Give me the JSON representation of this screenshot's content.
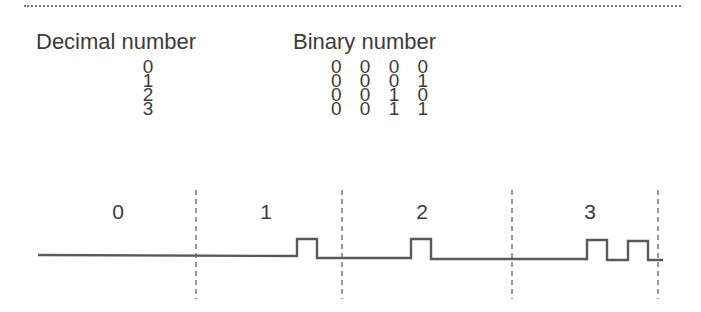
{
  "table": {
    "headers": {
      "decimal": "Decimal number",
      "binary": "Binary number"
    },
    "rows": [
      {
        "decimal": "0",
        "binary": "0 0 0 0"
      },
      {
        "decimal": "1",
        "binary": "0 0 0 1"
      },
      {
        "decimal": "2",
        "binary": "0 0 1 0"
      },
      {
        "decimal": "3",
        "binary": "0 0 1 1"
      }
    ]
  },
  "timing_diagram": {
    "slot_labels": [
      "0",
      "1",
      "2",
      "3"
    ],
    "pulse_counts": [
      0,
      1,
      1,
      2
    ],
    "baseline_y": 255,
    "pulse_top_y": 239,
    "waveform_start_x": 38,
    "waveform_end_x": 663,
    "divider_x": [
      196,
      342,
      512,
      658
    ],
    "pulses": [
      {
        "slot": "1",
        "x_start": 297,
        "x_end": 317
      },
      {
        "slot": "2",
        "x_start": 411,
        "x_end": 431
      },
      {
        "slot": "3",
        "x_start": 587,
        "x_end": 607
      },
      {
        "slot": "3",
        "x_start": 628,
        "x_end": 648
      }
    ],
    "line_color": "#5a5a5a",
    "divider_color": "#555555"
  }
}
